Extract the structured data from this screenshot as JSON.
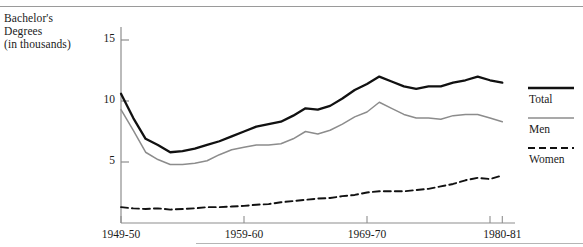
{
  "axis_title": {
    "line1": "Bachelor's",
    "line2": "Degrees",
    "line3": "(in thousands)"
  },
  "legend": {
    "items": [
      {
        "label": "Total",
        "style": "solid-thick",
        "color": "#111111"
      },
      {
        "label": "Men",
        "style": "solid-thin",
        "color": "#8c8c8c"
      },
      {
        "label": "Women",
        "style": "dashed",
        "color": "#111111"
      }
    ]
  },
  "chart_data": {
    "type": "line",
    "title": "",
    "subtitle": "",
    "xlabel": "",
    "ylabel": "Bachelor's Degrees (in thousands)",
    "grid": false,
    "legend_position": "right",
    "xlim": [
      1949,
      1981
    ],
    "ylim": [
      0,
      16.5
    ],
    "yticks": [
      5,
      10,
      15
    ],
    "ytick_labels": [
      "5",
      "10",
      "15"
    ],
    "xticks": [
      1949,
      1959,
      1969,
      1979,
      1980
    ],
    "xtick_labels": [
      "1949-50",
      "1959-60",
      "1969-70",
      "1980-81"
    ],
    "xtick_label_positions": [
      1949,
      1959,
      1969,
      1980
    ],
    "x": [
      1949,
      1950,
      1951,
      1952,
      1953,
      1954,
      1955,
      1956,
      1957,
      1958,
      1959,
      1960,
      1961,
      1962,
      1963,
      1964,
      1965,
      1966,
      1967,
      1968,
      1969,
      1970,
      1971,
      1972,
      1973,
      1974,
      1975,
      1976,
      1977,
      1978,
      1979,
      1980
    ],
    "series": [
      {
        "name": "Total",
        "color": "#111111",
        "style": "solid-thick",
        "values": [
          10.6,
          8.6,
          6.9,
          6.4,
          5.8,
          5.9,
          6.1,
          6.4,
          6.7,
          7.1,
          7.5,
          7.9,
          8.1,
          8.3,
          8.8,
          9.4,
          9.3,
          9.6,
          10.2,
          10.9,
          11.4,
          12.0,
          11.6,
          11.2,
          11.0,
          11.2,
          11.2,
          11.5,
          11.7,
          12.0,
          11.7,
          11.5
        ]
      },
      {
        "name": "Men",
        "color": "#8c8c8c",
        "style": "solid-thin",
        "values": [
          9.3,
          7.6,
          5.8,
          5.2,
          4.8,
          4.8,
          4.9,
          5.1,
          5.6,
          6.0,
          6.2,
          6.4,
          6.4,
          6.5,
          6.9,
          7.5,
          7.3,
          7.6,
          8.1,
          8.7,
          9.1,
          9.9,
          9.4,
          8.9,
          8.6,
          8.6,
          8.5,
          8.8,
          8.9,
          8.9,
          8.6,
          8.3
        ]
      },
      {
        "name": "Women",
        "color": "#111111",
        "style": "dashed",
        "values": [
          1.3,
          1.2,
          1.15,
          1.2,
          1.1,
          1.15,
          1.2,
          1.3,
          1.3,
          1.35,
          1.4,
          1.5,
          1.55,
          1.7,
          1.8,
          1.9,
          2.0,
          2.05,
          2.2,
          2.3,
          2.5,
          2.6,
          2.6,
          2.6,
          2.7,
          2.8,
          3.0,
          3.2,
          3.5,
          3.7,
          3.6,
          3.9
        ]
      }
    ]
  }
}
